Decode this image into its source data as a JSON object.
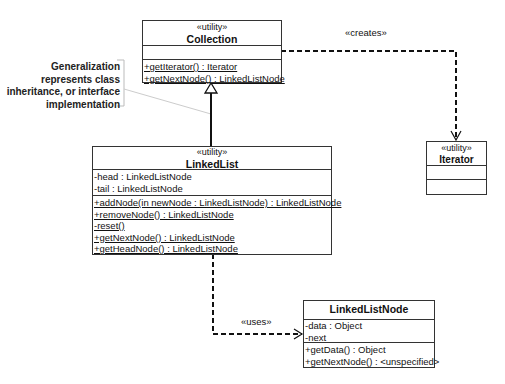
{
  "classes": {
    "collection": {
      "stereotype": "«utility»",
      "name": "Collection",
      "attributes": [],
      "operations": [
        "+getIterator() : Iterator",
        "+getNextNode() : LinkedListNode"
      ]
    },
    "linked_list": {
      "stereotype": "«utility»",
      "name": "LinkedList",
      "attributes": [
        "-head : LinkedListNode",
        "-tail : LinkedListNode"
      ],
      "operations": [
        "+addNode(in newNode : LinkedListNode) : LinkedListNode",
        "+removeNode() : LinkedListNode",
        "-reset()",
        "+getNextNode() : LinkedListNode",
        "+getHeadNode() : LinkedListNode"
      ]
    },
    "iterator": {
      "stereotype": "«utility»",
      "name": "Iterator",
      "attributes": [],
      "operations": []
    },
    "linked_list_node": {
      "name": "LinkedListNode",
      "attributes": [
        "-data : Object",
        "-next"
      ],
      "operations": [
        "+getData() : Object",
        "+getNextNode() : <unspecified>"
      ]
    }
  },
  "relations": {
    "creates_label": "«creates»",
    "uses_label": "«uses»"
  },
  "note": {
    "lines": [
      "Generalization",
      "represents class",
      "inheritance, or interface",
      "implementation"
    ]
  },
  "colors": {
    "line": "#111111",
    "note_line": "#c8c8c8",
    "border": "#333333"
  }
}
